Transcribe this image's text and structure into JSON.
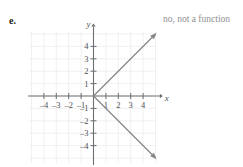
{
  "exercise": {
    "label": "e.",
    "answer_note": "no, not a function"
  },
  "chart_data": {
    "type": "line",
    "title": "",
    "xlabel": "x",
    "ylabel": "y",
    "grid": true,
    "legend": "none",
    "xlim": [
      -5,
      5
    ],
    "ylim": [
      -5,
      5
    ],
    "xticks": [
      -4,
      -3,
      -2,
      -1,
      1,
      2,
      3,
      4
    ],
    "yticks": [
      4,
      3,
      2,
      1,
      -1,
      -2,
      -3,
      -4
    ],
    "xtick_labels": [
      "-4",
      "-3",
      "-2",
      "-1",
      "1",
      "2",
      "3",
      "4"
    ],
    "ytick_labels": [
      "4",
      "3",
      "2",
      "1",
      "-1",
      "-2",
      "-3",
      "-4"
    ],
    "series": [
      {
        "name": "upper ray",
        "comment": "ray from origin to upper right, slope +1, arrowhead at end",
        "x": [
          0,
          5
        ],
        "y": [
          0,
          5
        ],
        "arrow_end": true
      },
      {
        "name": "lower ray",
        "comment": "ray from origin to lower right, slope -1, arrowhead at end",
        "x": [
          0,
          5
        ],
        "y": [
          0,
          -5
        ],
        "arrow_end": true
      }
    ],
    "annotations": [
      "no, not a function"
    ],
    "relation": "x = |y|",
    "is_function": false
  },
  "colors": {
    "grid": "#ececed",
    "axis": "#6d6e71",
    "curve": "#868789",
    "label_text": "#231f20",
    "note_text": "#908f93",
    "tick_text": "#4f4f52"
  },
  "axis_labels": {
    "x": "x",
    "y": "y"
  }
}
